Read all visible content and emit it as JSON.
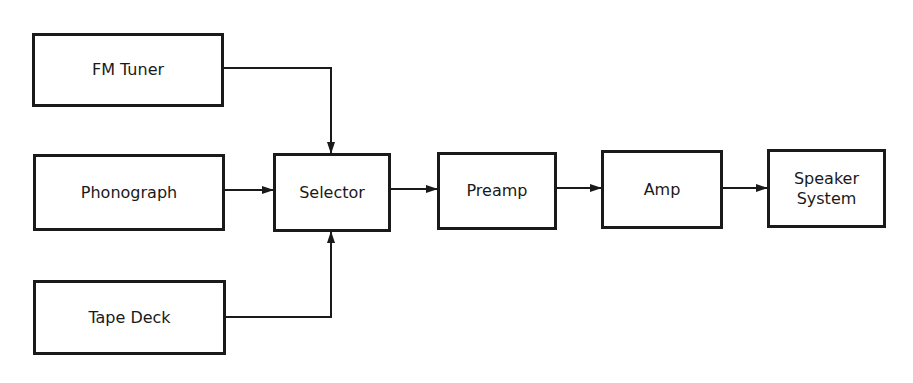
{
  "diagram": {
    "type": "block-diagram",
    "colors": {
      "stroke": "#1a1a1a",
      "background": "#ffffff"
    },
    "nodes": [
      {
        "id": "fm_tuner",
        "label": "FM Tuner",
        "x": 32,
        "y": 33,
        "w": 192,
        "h": 74
      },
      {
        "id": "phonograph",
        "label": "Phonograph",
        "x": 33,
        "y": 154,
        "w": 192,
        "h": 77
      },
      {
        "id": "tape_deck",
        "label": "Tape Deck",
        "x": 33,
        "y": 280,
        "w": 193,
        "h": 75
      },
      {
        "id": "selector",
        "label": "Selector",
        "x": 273,
        "y": 153,
        "w": 118,
        "h": 79
      },
      {
        "id": "preamp",
        "label": "Preamp",
        "x": 437,
        "y": 152,
        "w": 120,
        "h": 78
      },
      {
        "id": "amp",
        "label": "Amp",
        "x": 601,
        "y": 150,
        "w": 122,
        "h": 79
      },
      {
        "id": "speaker",
        "label": "Speaker\nSystem",
        "x": 767,
        "y": 149,
        "w": 119,
        "h": 79
      }
    ],
    "edges": [
      {
        "from": "fm_tuner",
        "to": "selector",
        "points": [
          [
            224,
            68
          ],
          [
            331,
            68
          ],
          [
            331,
            153
          ]
        ]
      },
      {
        "from": "phonograph",
        "to": "selector",
        "points": [
          [
            225,
            190
          ],
          [
            273,
            190
          ]
        ]
      },
      {
        "from": "tape_deck",
        "to": "selector",
        "points": [
          [
            226,
            317
          ],
          [
            331,
            317
          ],
          [
            331,
            232
          ]
        ]
      },
      {
        "from": "selector",
        "to": "preamp",
        "points": [
          [
            391,
            189
          ],
          [
            437,
            189
          ]
        ]
      },
      {
        "from": "preamp",
        "to": "amp",
        "points": [
          [
            557,
            188
          ],
          [
            601,
            188
          ]
        ]
      },
      {
        "from": "amp",
        "to": "speaker",
        "points": [
          [
            723,
            188
          ],
          [
            767,
            188
          ]
        ]
      }
    ]
  }
}
